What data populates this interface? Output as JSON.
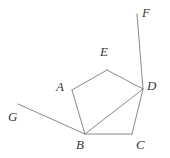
{
  "figure": {
    "background_color": "#ffffff",
    "line_color": "#8a8a8a",
    "label_color": "#3a3a3a",
    "width": 170,
    "height": 158,
    "points": {
      "A": {
        "x": 72,
        "y": 90,
        "label": "A",
        "label_x": 56,
        "label_y": 80
      },
      "B": {
        "x": 85,
        "y": 134,
        "label": "B",
        "label_x": 76,
        "label_y": 138
      },
      "C": {
        "x": 132,
        "y": 134,
        "label": "C",
        "label_x": 136,
        "label_y": 138
      },
      "D": {
        "x": 143,
        "y": 89,
        "label": "D",
        "label_x": 147,
        "label_y": 79
      },
      "E": {
        "x": 107,
        "y": 70,
        "label": "E",
        "label_x": 100,
        "label_y": 45
      },
      "F": {
        "x": 137,
        "y": 14,
        "label": "F",
        "label_x": 142,
        "label_y": 6
      },
      "G": {
        "x": 18,
        "y": 104,
        "label": "G",
        "label_x": 8,
        "label_y": 110
      }
    },
    "segments": [
      {
        "name": "segment-AE",
        "from": "A",
        "to": "E"
      },
      {
        "name": "segment-ED",
        "from": "E",
        "to": "D"
      },
      {
        "name": "segment-AB",
        "from": "A",
        "to": "B"
      },
      {
        "name": "segment-BD",
        "from": "B",
        "to": "D"
      },
      {
        "name": "segment-BC",
        "from": "B",
        "to": "C"
      },
      {
        "name": "segment-CD",
        "from": "C",
        "to": "D"
      },
      {
        "name": "ray-FD",
        "from": "F",
        "to": "D"
      },
      {
        "name": "ray-GB",
        "from": "G",
        "to": "B"
      }
    ]
  }
}
